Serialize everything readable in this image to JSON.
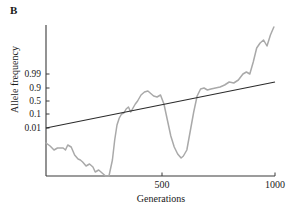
{
  "panel": {
    "label": "B"
  },
  "axes": {
    "y_title": "Allele frequency",
    "x_title": "Generations",
    "y_ticks": [
      {
        "label": "0.99",
        "y": 74
      },
      {
        "label": "0.9",
        "y": 88
      },
      {
        "label": "0.5",
        "y": 101
      },
      {
        "label": "0.1",
        "y": 114
      },
      {
        "label": "0.01",
        "y": 128
      }
    ],
    "x_ticks": [
      {
        "label": "500",
        "x": 162
      },
      {
        "label": "1000",
        "x": 275
      }
    ]
  },
  "colors": {
    "axis": "#3a3a3a",
    "trend_line": "#2b2b2b",
    "trajectory": "#a9a9a9",
    "background": "#ffffff",
    "text": "#1a1a1a"
  },
  "chart_data": {
    "type": "line",
    "title": "",
    "subtitle": "",
    "panel_label": "B",
    "xlabel": "Generations",
    "ylabel": "Allele frequency",
    "x_scale": "linear",
    "y_scale": "logit",
    "xlim": [
      0,
      1000
    ],
    "ylim": [
      0.0001,
      0.9999
    ],
    "grid": false,
    "legend": null,
    "x_tick_values": [
      500,
      1000
    ],
    "x_tick_labels": [
      "500",
      "1000"
    ],
    "y_tick_values": [
      0.99,
      0.9,
      0.5,
      0.1,
      0.01
    ],
    "y_tick_labels": [
      "0.99",
      "0.9",
      "0.5",
      "0.1",
      "0.01"
    ],
    "series": [
      {
        "name": "allele-frequency-trajectory",
        "style": "stochastic-wiggly-line",
        "color": "#a9a9a9",
        "x": [
          0,
          18,
          35,
          50,
          62,
          75,
          85,
          95,
          110,
          125,
          140,
          150,
          160,
          175,
          190,
          205,
          215,
          230,
          245,
          260,
          275,
          290,
          300,
          310,
          320,
          330,
          340,
          350,
          360,
          370,
          380,
          390,
          400,
          415,
          430,
          445,
          455,
          470,
          485,
          500,
          515,
          530,
          545,
          560,
          575,
          590,
          600,
          615,
          630,
          645,
          660,
          675,
          690,
          705,
          720,
          740,
          760,
          780,
          800,
          820,
          840,
          860,
          875,
          890,
          905,
          920,
          935,
          950,
          965,
          980,
          995
        ],
        "y_pixel": [
          143,
          146,
          150,
          148,
          148,
          148,
          150,
          145,
          147,
          155,
          159,
          160,
          162,
          166,
          164,
          167,
          172,
          170,
          173,
          176,
          176,
          160,
          140,
          125,
          118,
          114,
          113,
          109,
          107,
          112,
          108,
          104,
          101,
          95,
          92,
          91,
          93,
          96,
          97,
          95,
          104,
          120,
          136,
          147,
          154,
          158,
          156,
          150,
          131,
          112,
          96,
          89,
          88,
          90,
          89,
          88,
          87,
          85,
          82,
          83,
          80,
          74,
          72,
          74,
          62,
          48,
          43,
          40,
          46,
          35,
          27
        ],
        "notes": "Gray stochastic allele frequency trajectory; starts near low frequency, drifts down to near zero around generation ~290, rises sharply, plateaus near 0.5-0.9, dips back down near generation ~590, then rises steadily to near fixation by generation 1000."
      },
      {
        "name": "deterministic-trend-line",
        "style": "straight-line",
        "color": "#2b2b2b",
        "x": [
          0,
          1000
        ],
        "y_pixel": [
          128,
          82
        ],
        "notes": "Straight black line representing expected/deterministic logistic increase on logit scale, from just below 0.01 at generation 0 to just above 0.9 at generation 1000."
      }
    ]
  },
  "plot_geometry": {
    "left": 46,
    "right": 275,
    "top": 25,
    "bottom": 176
  }
}
